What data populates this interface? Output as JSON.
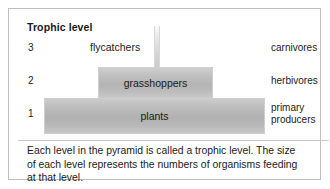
{
  "figure": {
    "header": "Trophic level",
    "levels": [
      {
        "number": "3",
        "organism": "flycatchers",
        "role": "carnivores",
        "role_line1": "carnivores",
        "role_line2": ""
      },
      {
        "number": "2",
        "organism": "grasshoppers",
        "role": "herbivores",
        "role_line1": "herbivores",
        "role_line2": ""
      },
      {
        "number": "1",
        "organism": "plants",
        "role": "primary producers",
        "role_line1": "primary",
        "role_line2": "producers"
      }
    ],
    "caption": {
      "line1": "Each level in the pyramid is called a trophic level. The size",
      "line2": "of each level represents the numbers of organisms feeding",
      "line3": "at that level."
    }
  },
  "chart_data": {
    "type": "bar",
    "title": "Trophic level",
    "orientation": "horizontal-pyramid",
    "categories": [
      "3",
      "2",
      "1"
    ],
    "bar_labels": [
      "flycatchers",
      "grasshoppers",
      "plants"
    ],
    "right_labels": [
      "carnivores",
      "herbivores",
      "primary producers"
    ],
    "values": [
      6,
      115,
      221
    ],
    "value_unit": "relative bar width (px)",
    "xlabel": "",
    "ylabel": "Trophic level",
    "grid": false,
    "legend": "none",
    "colors": {
      "bar_fill_light": "#cccccc",
      "bar_fill_dark": "#b1b1b1",
      "bar_border": "#cfcfcf",
      "frame_border": "#bfbfbf",
      "text": "#1b1b1b",
      "background": "#ffffff"
    },
    "annotation": "Each level in the pyramid is called a trophic level. The size of each level represents the numbers of organisms feeding at that level."
  }
}
